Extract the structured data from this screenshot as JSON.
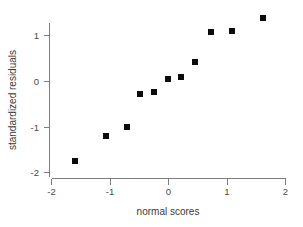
{
  "chart_data": {
    "type": "scatter",
    "title": "",
    "xlabel": "normal scores",
    "ylabel": "standardized residuals",
    "xlim": [
      -2.0,
      2.0
    ],
    "ylim": [
      -2.0,
      1.6
    ],
    "grid": false,
    "legend": null,
    "xticks": [
      -2,
      -1,
      0,
      1,
      2
    ],
    "xtick_labels": [
      "-2",
      "-1",
      "0",
      "1",
      "2"
    ],
    "yticks": [
      -2,
      -1,
      0,
      1
    ],
    "ytick_labels": [
      "-2",
      "-1",
      "0",
      "1"
    ],
    "marker": "filled-square",
    "marker_color": "#0b0b0b",
    "marker_size": 6,
    "n_points": 11,
    "x": [
      -1.59,
      -1.06,
      -0.7,
      -0.48,
      -0.24,
      0.0,
      0.22,
      0.46,
      0.73,
      1.09,
      1.62
    ],
    "y": [
      -1.75,
      -1.2,
      -1.0,
      -0.29,
      -0.23,
      0.05,
      0.08,
      0.42,
      1.08,
      1.1,
      1.38
    ],
    "points": [
      {
        "x": -1.59,
        "y": -1.75
      },
      {
        "x": -1.06,
        "y": -1.2
      },
      {
        "x": -0.7,
        "y": -1.0
      },
      {
        "x": -0.48,
        "y": -0.29
      },
      {
        "x": -0.24,
        "y": -0.23
      },
      {
        "x": 0.0,
        "y": 0.05
      },
      {
        "x": 0.22,
        "y": 0.08
      },
      {
        "x": 0.46,
        "y": 0.42
      },
      {
        "x": 0.73,
        "y": 1.08
      },
      {
        "x": 1.09,
        "y": 1.1
      },
      {
        "x": 1.62,
        "y": 1.38
      }
    ]
  },
  "figure": {
    "background_color": "#ffffff",
    "axis_color": "#7d7d7d",
    "text_color": "#3a3a3a"
  }
}
